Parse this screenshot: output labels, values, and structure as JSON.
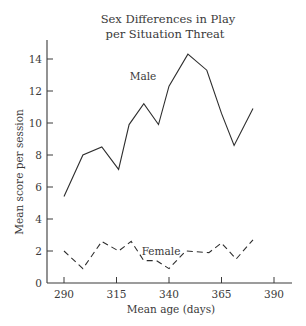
{
  "chart_data": {
    "type": "line",
    "title": "Sex Differences in Play per Situation Threat",
    "title_lines": [
      "Sex Differences in Play",
      "per Situation Threat"
    ],
    "xlabel": "Mean age (days)",
    "ylabel": "Mean score per session",
    "xlim": [
      282,
      398
    ],
    "ylim": [
      0,
      15
    ],
    "x_ticks": [
      290,
      315,
      340,
      365,
      390
    ],
    "y_ticks": [
      0,
      2,
      4,
      6,
      8,
      10,
      12,
      14
    ],
    "grid": false,
    "legend": "inline labels",
    "series": [
      {
        "name": "Male",
        "style": "solid",
        "x": [
          290,
          299,
          308,
          316,
          321,
          328,
          335,
          340,
          349,
          358,
          365,
          371,
          380
        ],
        "y": [
          5.4,
          8.0,
          8.5,
          7.1,
          9.9,
          11.2,
          9.9,
          12.3,
          14.3,
          13.3,
          10.6,
          8.6,
          10.9
        ]
      },
      {
        "name": "Female",
        "style": "dashed",
        "x": [
          290,
          299,
          308,
          316,
          322,
          328,
          334,
          340,
          348,
          359,
          365,
          372,
          380
        ],
        "y": [
          2.0,
          0.9,
          2.6,
          2.0,
          2.6,
          1.4,
          1.4,
          0.9,
          2.0,
          1.9,
          2.5,
          1.5,
          2.7
        ]
      }
    ]
  }
}
